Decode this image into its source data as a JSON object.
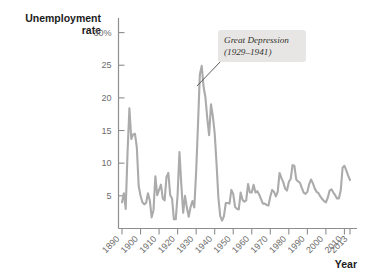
{
  "chart_data": {
    "type": "line",
    "title": "Unemployment rate",
    "xlabel": "Year",
    "ylabel": "Unemployment rate",
    "grid": false,
    "legend": "none",
    "ylim": [
      0,
      32
    ],
    "xlim": [
      1890,
      2013
    ],
    "ytick_labels": [
      "30%",
      "25",
      "20",
      "15",
      "10",
      "5"
    ],
    "ytick_values": [
      30,
      25,
      20,
      15,
      10,
      5
    ],
    "xtick_labels": [
      "1890",
      "1900",
      "1910",
      "1920",
      "1930",
      "1940",
      "1950",
      "1960",
      "1970",
      "1980",
      "1990",
      "2000",
      "2010",
      "2013"
    ],
    "xtick_values": [
      1890,
      1900,
      1910,
      1920,
      1930,
      1940,
      1950,
      1960,
      1970,
      1980,
      1990,
      2000,
      2010,
      2013
    ],
    "series_name": "Unemployment rate",
    "line_color": "#ababab",
    "x": [
      1890,
      1891,
      1892,
      1893,
      1894,
      1895,
      1896,
      1897,
      1898,
      1899,
      1900,
      1901,
      1902,
      1903,
      1904,
      1905,
      1906,
      1907,
      1908,
      1909,
      1910,
      1911,
      1912,
      1913,
      1914,
      1915,
      1916,
      1917,
      1918,
      1919,
      1920,
      1921,
      1922,
      1923,
      1924,
      1925,
      1926,
      1927,
      1928,
      1929,
      1930,
      1931,
      1932,
      1933,
      1934,
      1935,
      1936,
      1937,
      1938,
      1939,
      1940,
      1941,
      1942,
      1943,
      1944,
      1945,
      1946,
      1947,
      1948,
      1949,
      1950,
      1951,
      1952,
      1953,
      1954,
      1955,
      1956,
      1957,
      1958,
      1959,
      1960,
      1961,
      1962,
      1963,
      1964,
      1965,
      1966,
      1967,
      1968,
      1969,
      1970,
      1971,
      1972,
      1973,
      1974,
      1975,
      1976,
      1977,
      1978,
      1979,
      1980,
      1981,
      1982,
      1983,
      1984,
      1985,
      1986,
      1987,
      1988,
      1989,
      1990,
      1991,
      1992,
      1993,
      1994,
      1995,
      1996,
      1997,
      1998,
      1999,
      2000,
      2001,
      2002,
      2003,
      2004,
      2005,
      2006,
      2007,
      2008,
      2009,
      2010,
      2011,
      2012,
      2013
    ],
    "values": [
      4.0,
      5.4,
      3.0,
      11.7,
      18.4,
      13.7,
      14.4,
      14.5,
      12.4,
      6.5,
      5.0,
      4.0,
      3.7,
      3.9,
      5.4,
      4.3,
      1.7,
      2.8,
      8.0,
      5.1,
      5.9,
      6.7,
      4.6,
      4.3,
      7.9,
      8.5,
      5.1,
      4.6,
      1.4,
      1.4,
      5.2,
      11.7,
      6.7,
      2.4,
      5.0,
      3.2,
      1.8,
      3.3,
      4.2,
      3.2,
      8.7,
      15.9,
      23.6,
      24.9,
      21.7,
      20.1,
      16.9,
      14.3,
      19.0,
      17.2,
      14.6,
      9.9,
      4.7,
      1.9,
      1.2,
      1.9,
      3.9,
      3.9,
      3.8,
      5.9,
      5.3,
      3.3,
      3.0,
      2.9,
      5.5,
      4.4,
      4.1,
      4.3,
      6.8,
      5.5,
      5.5,
      6.7,
      5.5,
      5.7,
      5.2,
      4.5,
      3.8,
      3.8,
      3.6,
      3.5,
      4.9,
      5.9,
      5.6,
      4.9,
      5.6,
      8.5,
      7.7,
      7.1,
      6.1,
      5.8,
      7.1,
      7.6,
      9.7,
      9.6,
      7.5,
      7.2,
      7.0,
      6.2,
      5.5,
      5.3,
      5.6,
      6.8,
      7.5,
      6.9,
      6.1,
      5.6,
      5.4,
      4.9,
      4.5,
      4.2,
      4.0,
      4.7,
      5.8,
      6.0,
      5.5,
      5.1,
      4.6,
      4.6,
      5.8,
      9.3,
      9.6,
      8.9,
      8.1,
      7.4
    ]
  },
  "annotation": {
    "line1": "Great Depression",
    "line2": "(1929–1941)",
    "box_color": "#e7e6e4"
  },
  "labels": {
    "y_axis_title_line1": "Unemployment",
    "y_axis_title_line2": "rate",
    "x_axis_title": "Year"
  }
}
